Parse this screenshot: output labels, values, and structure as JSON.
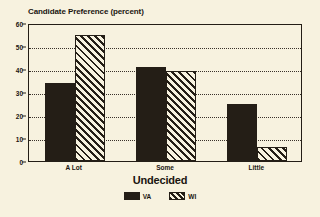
{
  "chart_data": {
    "type": "bar",
    "title": "Candidate Preference (percent)",
    "xlabel": "Undecided",
    "ylabel": "",
    "categories": [
      "A Lot",
      "Some",
      "Little"
    ],
    "series": [
      {
        "name": "VA",
        "values": [
          34,
          41,
          25
        ],
        "fill": "solid-black",
        "color": "#241e16"
      },
      {
        "name": "WI",
        "values": [
          55,
          39,
          6
        ],
        "fill": "diagonal-hatch",
        "color": "#241e16"
      }
    ],
    "ylim": [
      0,
      60
    ],
    "yticks": [
      0,
      10,
      20,
      30,
      40,
      50,
      60
    ],
    "ytick_labels": [
      "0",
      "10",
      "20",
      "30",
      "40",
      "50",
      "60"
    ],
    "grid": true,
    "grid_style": "dotted-horizontal",
    "legend_position": "bottom-center",
    "background_color": "#f7f2df",
    "axis_color": "#241e16"
  }
}
